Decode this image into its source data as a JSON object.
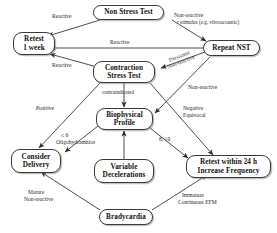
{
  "diagram": {
    "type": "flowchart",
    "nodes": [
      {
        "id": "nst",
        "lines": [
          "Non Stress Test"
        ]
      },
      {
        "id": "retest1week",
        "lines": [
          "Retest",
          "1 week"
        ]
      },
      {
        "id": "repeatnst",
        "lines": [
          "Repeat NST"
        ]
      },
      {
        "id": "cst",
        "lines": [
          "Contraction",
          "Stress Test"
        ]
      },
      {
        "id": "bpp",
        "lines": [
          "Biophysical",
          "Profile"
        ]
      },
      {
        "id": "variabledec",
        "lines": [
          "Variable",
          "Decelerations"
        ]
      },
      {
        "id": "considerdel",
        "lines": [
          "Consider",
          "Delivery"
        ]
      },
      {
        "id": "retest24h",
        "lines": [
          "Retest within 24 h",
          "Increase Frequency"
        ]
      },
      {
        "id": "bradycardia",
        "lines": [
          "Bradycardia"
        ]
      }
    ],
    "edges": [
      {
        "id": "e1",
        "from": "nst",
        "to": "retest1week",
        "label": [
          "Reactive"
        ]
      },
      {
        "id": "e2",
        "from": "nst",
        "to": "repeatnst",
        "label": [
          "Non-reactive",
          "• stimulus (e.g. vibroacoustic)"
        ]
      },
      {
        "id": "e3",
        "from": "repeatnst",
        "to": "retest1week",
        "label": [
          "Reactive"
        ]
      },
      {
        "id": "e4",
        "from": "repeatnst",
        "to": "cst",
        "label": [
          "Persistent",
          "Non-reactive"
        ]
      },
      {
        "id": "e5",
        "from": "cst",
        "to": "retest1week",
        "label": [
          "Reactive"
        ]
      },
      {
        "id": "e6",
        "from": "cst",
        "to": "bpp",
        "label": [
          "contraindicated"
        ]
      },
      {
        "id": "e7",
        "from": "cst",
        "to": "considerdel",
        "label": [
          "Positive"
        ]
      },
      {
        "id": "e8",
        "from": "cst",
        "to": "retest24h",
        "label": [
          "Negative",
          "Equivocal"
        ]
      },
      {
        "id": "e9",
        "from": "repeatnst",
        "to": "bpp",
        "label": [
          "Non-reactive"
        ]
      },
      {
        "id": "e10",
        "from": "bpp",
        "to": "considerdel",
        "label": [
          "≤ 6",
          "Oligohydramnios"
        ]
      },
      {
        "id": "e11",
        "from": "bpp",
        "to": "retest24h",
        "label": [
          "8, 10"
        ]
      },
      {
        "id": "e12",
        "from": "variabledec",
        "to": "bpp",
        "label": []
      },
      {
        "id": "e13",
        "from": "bradycardia",
        "to": "considerdel",
        "label": [
          "Mature",
          "Non-reactive"
        ]
      },
      {
        "id": "e14",
        "from": "bradycardia",
        "to": "retest24h",
        "label": [
          "Immature",
          "Continuous EFM"
        ]
      }
    ],
    "labels": {
      "reactive_top": "Reactive",
      "nonreactive_line1": "Non-reactive",
      "nonreactive_line2": "• stimulus (e.g. vibroacoustic)",
      "reactive_mid": "Reactive",
      "persistent": "Persistent",
      "persistent2": "Non-reactive",
      "reactive_cst": "Reactive",
      "nonreactive_right": "Non-reactive",
      "contraindicated": "contraindicated",
      "positive": "Positive",
      "negative": "Negative",
      "equivocal": "Equivocal",
      "le6": "≤ 6",
      "oligo": "Oligohydramnios",
      "eight_ten": "8, 10",
      "mature": "Mature",
      "mature2": "Non-reactive",
      "immature": "Immature",
      "immature2": "Continuous EFM"
    },
    "colors": {
      "stroke": "#3a3a3a",
      "text": "#111111",
      "label_text": "#2b2b2b",
      "background": "#ffffff"
    }
  }
}
